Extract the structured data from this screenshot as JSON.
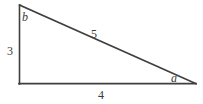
{
  "figure": {
    "background_color": "#ffffff",
    "stroke_color": "#3f3f3f",
    "text_color": "#3a3a3a"
  },
  "geometry": {
    "vertices": {
      "top_left": {
        "x": 19,
        "y": 5
      },
      "bottom_left": {
        "x": 19,
        "y": 84
      },
      "bottom_right": {
        "x": 196,
        "y": 84
      }
    },
    "stroke_width": 1.6
  },
  "labels": {
    "leg_vertical": "3",
    "leg_base": "4",
    "hypotenuse": "5",
    "angle_a": "a",
    "angle_b": "b"
  }
}
